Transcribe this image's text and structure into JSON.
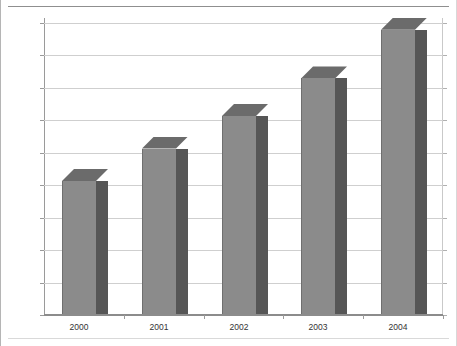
{
  "chart_data": {
    "type": "bar",
    "title": "",
    "subtitle": "",
    "xlabel": "",
    "ylabel": "",
    "categories": [
      "2000",
      "2001",
      "2002",
      "2003",
      "2004"
    ],
    "values": [
      205,
      255,
      305,
      363,
      438
    ],
    "value_prefix": "$",
    "ylim": [
      0,
      450
    ],
    "ytick_labels": [
      "$450",
      "$400",
      "$350",
      "$300",
      "$250",
      "$200",
      "$150",
      "$100",
      "$50",
      "$0"
    ],
    "ytick_values": [
      450,
      400,
      350,
      300,
      250,
      200,
      150,
      100,
      50,
      0
    ],
    "ytick_step": 50,
    "grid": true,
    "legend": null,
    "legend_position": "none",
    "style": "3d-column",
    "colors": {
      "bar_front": "#8b8b8b",
      "bar_side": "#565656",
      "bar_top": "#6b6b6b",
      "bar_outline": "#6f6f6f",
      "gridline": "#cfcfcf",
      "axis": "#8c8c8c",
      "text": "#333333",
      "background": "#ffffff"
    }
  }
}
